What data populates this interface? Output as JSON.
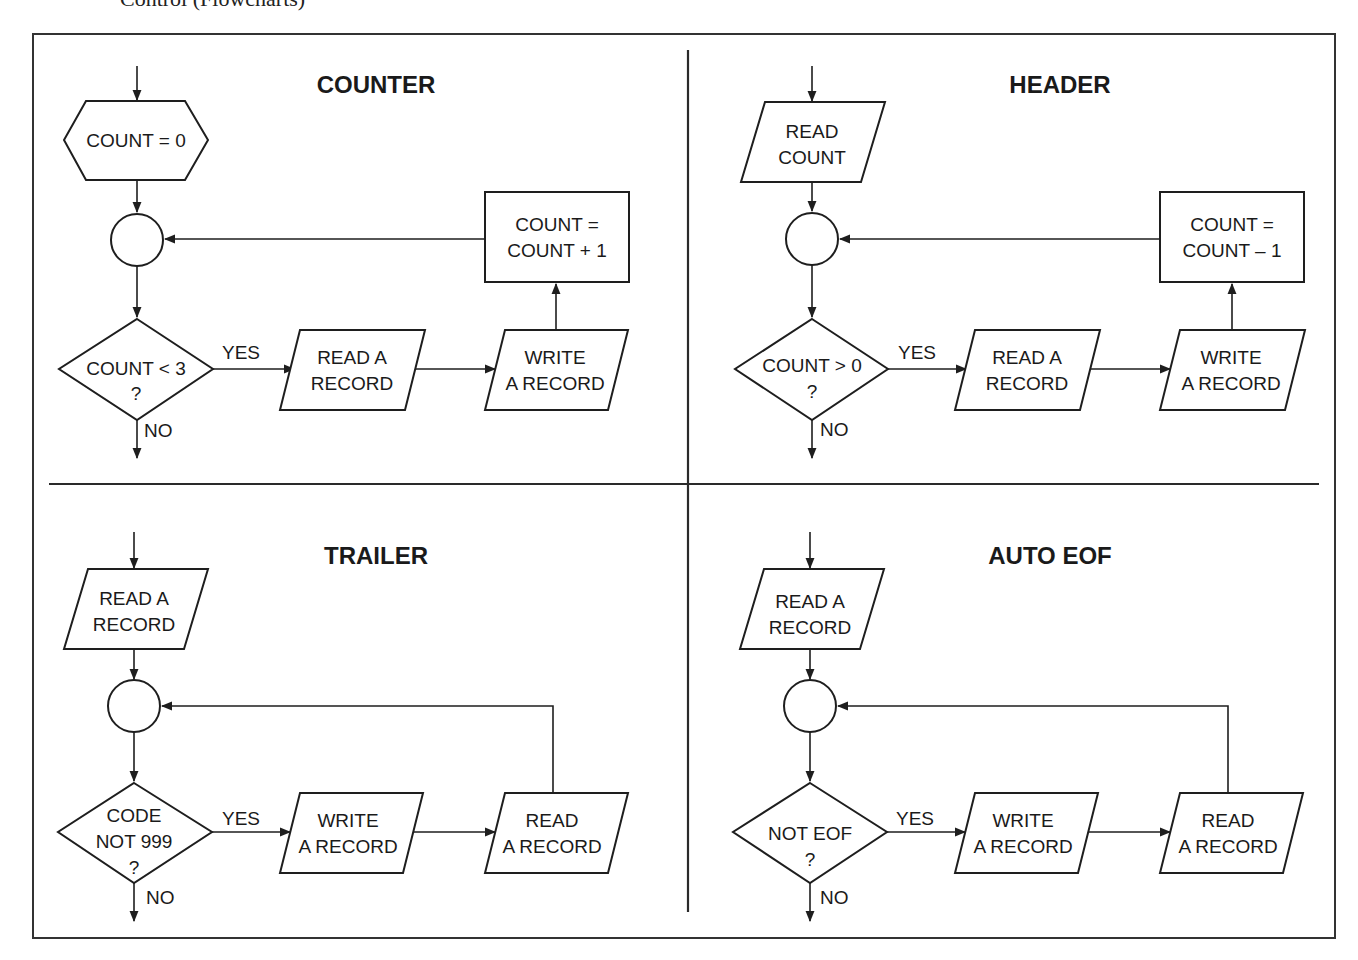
{
  "page": {
    "title": "Control (Flowcharts)"
  },
  "colors": {
    "ink": "#1e1e1e",
    "background": "#ffffff"
  },
  "quadrants": {
    "counter": {
      "title": "COUNTER",
      "init": "COUNT = 0",
      "update": [
        "COUNT =",
        "COUNT + 1"
      ],
      "decision": [
        "COUNT < 3",
        "?"
      ],
      "yes": "YES",
      "no": "NO",
      "step1": [
        "READ A",
        "RECORD"
      ],
      "step2": [
        "WRITE",
        "A RECORD"
      ]
    },
    "header": {
      "title": "HEADER",
      "init": [
        "READ",
        "COUNT"
      ],
      "update": [
        "COUNT =",
        "COUNT – 1"
      ],
      "decision": [
        "COUNT > 0",
        "?"
      ],
      "yes": "YES",
      "no": "NO",
      "step1": [
        "READ A",
        "RECORD"
      ],
      "step2": [
        "WRITE",
        "A RECORD"
      ]
    },
    "trailer": {
      "title": "TRAILER",
      "init": [
        "READ A",
        "RECORD"
      ],
      "decision": [
        "CODE",
        "NOT 999",
        "?"
      ],
      "yes": "YES",
      "no": "NO",
      "step1": [
        "WRITE",
        "A RECORD"
      ],
      "step2": [
        "READ",
        "A RECORD"
      ]
    },
    "auto_eof": {
      "title": "AUTO EOF",
      "init": [
        "READ A",
        "RECORD"
      ],
      "decision": [
        "NOT EOF",
        "?"
      ],
      "yes": "YES",
      "no": "NO",
      "step1": [
        "WRITE",
        "A RECORD"
      ],
      "step2": [
        "READ",
        "A RECORD"
      ]
    }
  }
}
